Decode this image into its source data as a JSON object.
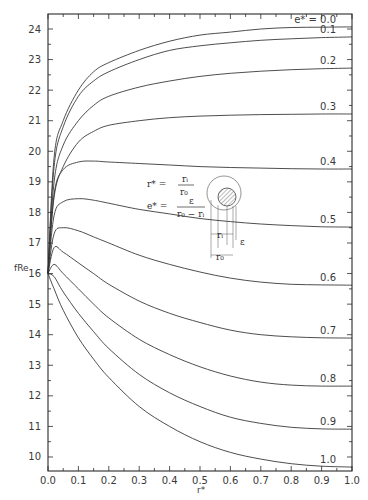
{
  "chart_data": {
    "type": "line",
    "title": "",
    "xlabel": "r*",
    "ylabel": "fRe",
    "xlim": [
      0.0,
      1.0
    ],
    "ylim": [
      9.5,
      24.5
    ],
    "grid": false,
    "legend_position": "inline labels at right end of curves",
    "x_ticks": [
      "0.0",
      "0.1",
      "0.2",
      "0.3",
      "0.4",
      "0.5",
      "0.6",
      "0.7",
      "0.8",
      "0.9",
      "1.0"
    ],
    "y_ticks": [
      "10",
      "11",
      "12",
      "13",
      "14",
      "15",
      "16",
      "17",
      "18",
      "19",
      "20",
      "21",
      "22",
      "23",
      "24"
    ],
    "parameter_label": "e* =",
    "x": [
      0.0,
      0.02,
      0.05,
      0.1,
      0.15,
      0.2,
      0.3,
      0.4,
      0.5,
      0.6,
      0.7,
      0.8,
      0.9,
      1.0
    ],
    "series": [
      {
        "name": "0.0",
        "label": "e* = 0.0",
        "values": [
          16.0,
          19.8,
          21.0,
          22.0,
          22.6,
          22.9,
          23.3,
          23.6,
          23.8,
          23.9,
          24.0,
          24.05,
          24.06,
          24.07
        ]
      },
      {
        "name": "0.1",
        "label": "0.1",
        "values": [
          16.0,
          19.5,
          20.8,
          21.8,
          22.3,
          22.6,
          23.0,
          23.3,
          23.45,
          23.55,
          23.63,
          23.68,
          23.72,
          23.74
        ]
      },
      {
        "name": "0.2",
        "label": "0.2",
        "values": [
          16.0,
          19.0,
          20.2,
          21.0,
          21.5,
          21.8,
          22.1,
          22.3,
          22.45,
          22.55,
          22.62,
          22.67,
          22.7,
          22.72
        ]
      },
      {
        "name": "0.3",
        "label": "0.3",
        "values": [
          16.0,
          18.5,
          19.5,
          20.3,
          20.65,
          20.85,
          21.0,
          21.1,
          21.15,
          21.18,
          21.2,
          21.21,
          21.22,
          21.22
        ]
      },
      {
        "name": "0.4",
        "label": "0.4",
        "values": [
          16.0,
          18.6,
          19.4,
          19.65,
          19.68,
          19.65,
          19.6,
          19.55,
          19.5,
          19.47,
          19.45,
          19.43,
          19.42,
          19.42
        ]
      },
      {
        "name": "0.5",
        "label": "0.5",
        "values": [
          16.0,
          17.9,
          18.35,
          18.45,
          18.4,
          18.3,
          18.1,
          17.95,
          17.8,
          17.7,
          17.62,
          17.57,
          17.53,
          17.52
        ]
      },
      {
        "name": "0.6",
        "label": "0.6",
        "values": [
          16.0,
          17.3,
          17.5,
          17.4,
          17.2,
          17.0,
          16.6,
          16.3,
          16.05,
          15.85,
          15.72,
          15.65,
          15.63,
          15.62
        ]
      },
      {
        "name": "0.7",
        "label": "0.7",
        "values": [
          16.0,
          16.85,
          16.7,
          16.35,
          16.0,
          15.65,
          15.1,
          14.7,
          14.4,
          14.15,
          14.0,
          13.93,
          13.9,
          13.89
        ]
      },
      {
        "name": "0.8",
        "label": "0.8",
        "values": [
          16.0,
          16.3,
          16.0,
          15.5,
          15.0,
          14.55,
          13.85,
          13.35,
          12.95,
          12.65,
          12.45,
          12.35,
          12.32,
          12.32
        ]
      },
      {
        "name": "0.9",
        "label": "0.9",
        "values": [
          16.0,
          15.9,
          15.4,
          14.7,
          14.1,
          13.55,
          12.7,
          12.1,
          11.65,
          11.3,
          11.1,
          10.97,
          10.92,
          10.91
        ]
      },
      {
        "name": "1.0",
        "label": "1.0",
        "values": [
          16.0,
          15.5,
          14.8,
          13.9,
          13.2,
          12.6,
          11.65,
          11.0,
          10.5,
          10.15,
          9.93,
          9.78,
          9.7,
          9.67
        ]
      }
    ],
    "annotations": {
      "formula_r": {
        "lhs": "r* =",
        "num": "rᵢ",
        "den": "r₀"
      },
      "formula_e": {
        "lhs": "e* =",
        "num": "ε",
        "den": "r₀ − rᵢ"
      },
      "diagram_labels": {
        "ri": "rᵢ",
        "ro": "r₀",
        "eps": "ε"
      }
    },
    "colors": {
      "line": "#3a3a3a",
      "axis": "#2a2a2a",
      "background": "#ffffff"
    }
  }
}
